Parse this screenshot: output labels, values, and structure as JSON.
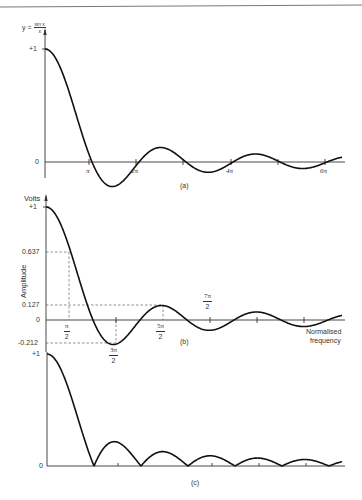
{
  "figure": {
    "panel_a": {
      "y_label": "y =",
      "y_label_num": "sin x",
      "y_label_den": "x",
      "y_ticks": [
        "+1",
        "0"
      ],
      "x_ticks": [
        "π",
        "2π",
        "4π",
        "6π"
      ],
      "caption": "(a)"
    },
    "panel_b": {
      "y_unit": "Volts",
      "y_axis_title": "Amplitude",
      "y_ticks": [
        "+1",
        "0.637",
        "0.127",
        "0",
        "-0.212"
      ],
      "x_ticks": [
        {
          "num": "π",
          "den": "2"
        },
        {
          "num": "3π",
          "den": "2"
        },
        {
          "num": "5π",
          "den": "2"
        },
        {
          "num": "7π",
          "den": "2"
        }
      ],
      "x_axis_title_line1": "Normalised",
      "x_axis_title_line2": "frequency",
      "caption": "(b)"
    },
    "panel_c": {
      "y_ticks": [
        "+1",
        "0"
      ],
      "caption": "(c)"
    }
  },
  "chart_data": [
    {
      "type": "line",
      "title": "y = sin x / x",
      "xlabel": "",
      "ylabel": "y",
      "x_tick_labels": [
        "π",
        "2π",
        "4π",
        "6π"
      ],
      "y_tick_labels": [
        "+1",
        "0"
      ],
      "function": "sin(x)/x",
      "x_range": [
        0,
        6.6
      ],
      "x_units": "π",
      "ylim": [
        -0.25,
        1
      ]
    },
    {
      "type": "line",
      "title": "",
      "xlabel": "Normalised frequency",
      "ylabel": "Amplitude (Volts)",
      "function": "sin(x)/x",
      "annotated_points": [
        {
          "x": "π/2",
          "y": 0.637
        },
        {
          "x": "3π/2",
          "y": -0.212
        },
        {
          "x": "5π/2",
          "y": 0.127
        },
        {
          "x": "7π/2",
          "y": null
        }
      ],
      "y_tick_labels": [
        "+1",
        "0.637",
        "0.127",
        "0",
        "-0.212"
      ],
      "ylim": [
        -0.25,
        1
      ]
    },
    {
      "type": "line",
      "title": "",
      "function": "|sin(x)/x|",
      "y_tick_labels": [
        "+1",
        "0"
      ],
      "ylim": [
        0,
        1
      ]
    }
  ]
}
